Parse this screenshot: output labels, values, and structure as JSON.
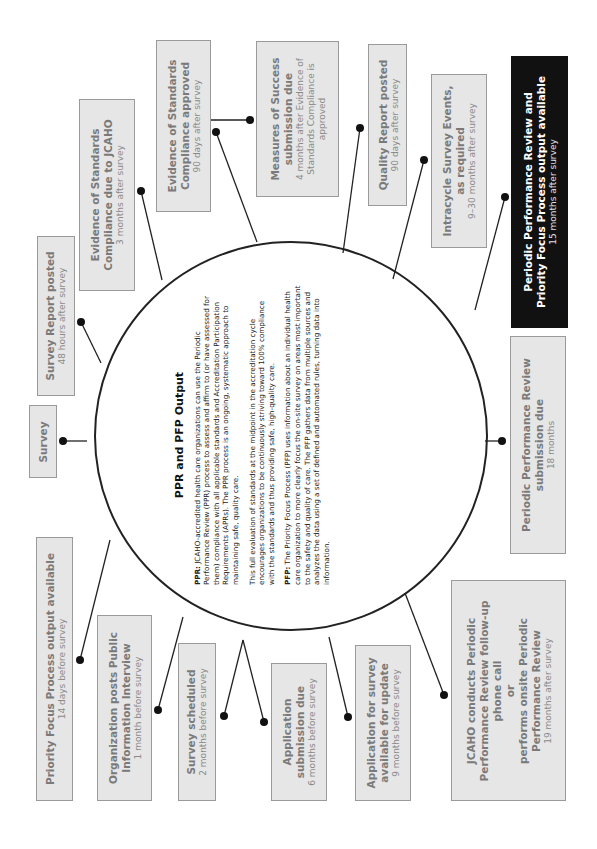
{
  "center": {
    "title": "PPR and PFP Output",
    "ppr_label": "PPR:",
    "ppr_text": "JCAHO-accredited health care organizations can use the Periodic Performance Review (PPR) process to assess and affirm to (or have assessed for them) compliance with all applicable standards and Accreditation Participation Requirements (APRs). The PPR process is an ongoing, systematic approach to maintaining safe, quality care.",
    "midpoint_text": "This full evaluation of standards at the midpoint in the accreditation cycle encourages organizations to be continuously striving toward 100% compliance with the standards and thus providing safe, high-quality care.",
    "pfp_label": "PFP:",
    "pfp_text": "The Priority Focus Process (PFP) uses information about an individual health care organization to more clearly focus the on-site survey on areas most important to the safety and quality of care. The PFP gathers data from multiple sources and analyzes the data using a set of defined and automated rules, turning data into information."
  },
  "events": [
    {
      "title": "Priority Focus Process output available",
      "sub": "14 days before survey"
    },
    {
      "title": "Organization posts Public\nInformation Interview",
      "sub": "1 month before survey"
    },
    {
      "title": "Survey scheduled",
      "sub": "2 months before survey"
    },
    {
      "title": "Application\nsubmission due",
      "sub": "6 months before survey"
    },
    {
      "title": "Application for survey\navailable for update",
      "sub": "9 months before survey"
    },
    {
      "title": "JCAHO conducts Periodic\nPerformance Review follow-up\nphone call\nor\nperforms onsite Periodic\nPerformance Review",
      "sub": "19 months after survey"
    },
    {
      "title": "Periodic Performance Review\nsubmission due",
      "sub": "18 months"
    },
    {
      "title": "Periodic Performance Review and\nPriority Focus Process output available",
      "sub": "15 months after survey"
    },
    {
      "title": "Intracycle Survey Events,\nas required",
      "sub": "9–30 months after survey"
    },
    {
      "title": "Quality Report posted",
      "sub": "90 days after survey"
    },
    {
      "title": "Measures of Success\nsubmission due",
      "sub": "4 months after Evidence of\nStandards Compliance is\napproved"
    },
    {
      "title": "Evidence of Standards\nCompliance approved",
      "sub": "90 days after survey"
    },
    {
      "title": "Evidence of Standards\nCompliance due to JCAHO",
      "sub": "3 months after survey"
    },
    {
      "title": "Survey Report posted",
      "sub": "48 hours after survey"
    },
    {
      "title": "Survey",
      "sub": ""
    }
  ],
  "colors": {
    "box_fill": "#e6e6e6",
    "box_border": "#9a9a9a",
    "box_text": "#7a7a7a",
    "highlight_fill": "#111111",
    "highlight_text": "#ffffff",
    "line": "#222222"
  }
}
